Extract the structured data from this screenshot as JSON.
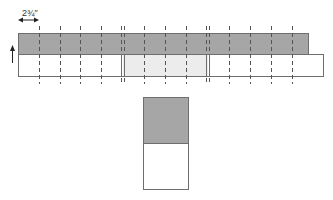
{
  "diagram": {
    "type": "strip-cutting-diagram",
    "measurement_label": "2¾″",
    "colors": {
      "dark_fabric": "#a6a6a6",
      "light_fabric": "#ffffff",
      "highlight_segment": "#ececec",
      "outline": "#6e6e6e",
      "dash": "#555555",
      "background": "#ffffff"
    },
    "strip_set": {
      "dark_strip": {
        "x": 18,
        "y": 33,
        "width": 290,
        "height": 21
      },
      "light_strip": {
        "x": 18,
        "y": 54,
        "width": 305,
        "height": 22
      },
      "cut_lines_x": [
        39,
        60,
        80,
        101,
        144,
        165,
        186,
        229,
        250,
        271,
        292
      ],
      "double_cut_lines_x": [
        123,
        208
      ],
      "cut_line_y_range": [
        26,
        84
      ],
      "highlighted_segment": {
        "x": 123,
        "width": 85
      }
    },
    "measurement": {
      "from_x": 18,
      "to_x": 39,
      "arrow_y": 20,
      "label_x": 22,
      "label_y": 9
    },
    "direction_arrow": {
      "x": 12,
      "y_top": 45,
      "y_bottom": 63,
      "direction": "up"
    },
    "result_unit": {
      "x": 143,
      "y": 97,
      "width": 45,
      "height": 92,
      "split_y": 143
    }
  }
}
